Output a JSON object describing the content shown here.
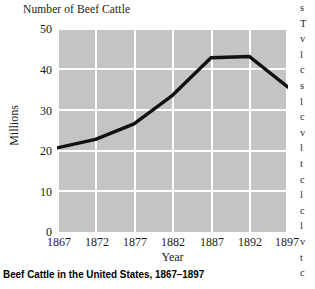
{
  "chart_data": {
    "type": "line",
    "title": "Number of Beef Cattle",
    "xlabel": "Year",
    "ylabel": "Millions",
    "x": [
      1867,
      1872,
      1877,
      1882,
      1887,
      1892,
      1897
    ],
    "categories": [
      "1867",
      "1872",
      "1877",
      "1882",
      "1887",
      "1892",
      "1897"
    ],
    "values": [
      20.6,
      22.7,
      26.5,
      33.5,
      42.7,
      43.0,
      35.5
    ],
    "series": [
      {
        "name": "Number of Beef Cattle",
        "values": [
          20.6,
          22.7,
          26.5,
          33.5,
          42.7,
          43.0,
          35.5
        ]
      }
    ],
    "xlim": [
      1867,
      1897
    ],
    "ylim": [
      0,
      50
    ],
    "yticks": [
      0,
      10,
      20,
      30,
      40,
      50
    ],
    "ytick_labels": [
      "0",
      "10",
      "20",
      "30",
      "40",
      "50"
    ],
    "xticks": [
      1867,
      1872,
      1877,
      1882,
      1887,
      1892,
      1897
    ],
    "grid": true,
    "legend": "none",
    "plot_background_color": "#c4c4c4",
    "gridline_color": "#ffffff",
    "line_color": "#111111",
    "page_background_color": "#ffffff"
  },
  "caption": {
    "text": "Beef Cattle in the United States, 1867–1897"
  },
  "edge_text": {
    "lines": [
      "s",
      "T",
      "v",
      "l",
      "c",
      "s",
      "l",
      "c",
      "v",
      "l",
      "t",
      "c",
      "l",
      "c",
      "l",
      "v",
      "t",
      "c"
    ]
  }
}
